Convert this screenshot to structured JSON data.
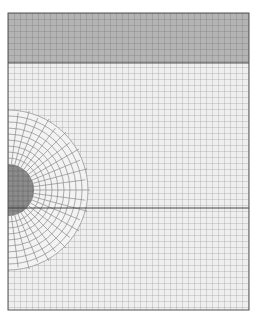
{
  "figure": {
    "domain": {
      "x": 8,
      "y": 13,
      "width": 241,
      "height": 297
    },
    "top_layer": {
      "y_end": 63,
      "color": "#b4b4b4"
    },
    "interface_line_y": 208,
    "inclusion": {
      "cx": 8,
      "cy": 190,
      "r": 26,
      "color": "#8c8c8c"
    },
    "refined_zone": {
      "r": 85
    },
    "grid_spacing": 6,
    "colors": {
      "grid": "#9a9a9a",
      "background": "#efefef",
      "border": "#555555",
      "line": "#333333"
    }
  }
}
